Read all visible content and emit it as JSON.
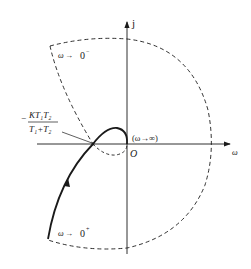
{
  "diagram": {
    "type": "nyquist-plot",
    "axes": {
      "imag_label": "j",
      "real_label": "ω",
      "origin_label": "O"
    },
    "annotations": {
      "omega_zero_minus": {
        "symbol": "ω",
        "arrow": "→",
        "value": "0",
        "sup": "−"
      },
      "omega_zero_plus": {
        "symbol": "ω",
        "arrow": "→",
        "value": "0",
        "sup": "+"
      },
      "omega_infinity": "(ω→∞)",
      "crossing_point": {
        "sign": "−",
        "numerator": "KT₁T₂",
        "denominator": "T₁+T₂"
      }
    },
    "colors": {
      "stroke": "#1a1a1a",
      "background": "#ffffff"
    }
  }
}
